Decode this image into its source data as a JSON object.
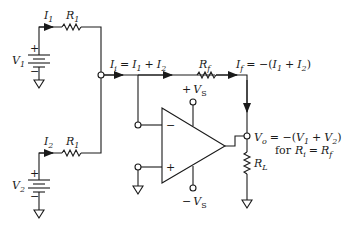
{
  "colors": {
    "ink": "#1a1a1a",
    "background": "#ffffff"
  },
  "sources": [
    {
      "name": "V",
      "sub": "1",
      "polarity_plus": "+",
      "polarity_minus": "−"
    },
    {
      "name": "V",
      "sub": "2",
      "polarity_plus": "+",
      "polarity_minus": "−"
    }
  ],
  "branches": [
    {
      "current": "I",
      "current_sub": "1",
      "resistor": "R",
      "resistor_sub": "1"
    },
    {
      "current": "I",
      "current_sub": "2",
      "resistor": "R",
      "resistor_sub": "1"
    }
  ],
  "node_current": {
    "lhs": "I",
    "lhs_sub": "i",
    "eq": "=",
    "t1": "I",
    "t1_sub": "1",
    "plus": "+",
    "t2": "I",
    "t2_sub": "2"
  },
  "feedback": {
    "resistor": "R",
    "resistor_sub": "f",
    "current": "I",
    "current_sub": "f",
    "eq": "= −(",
    "t1": "I",
    "t1_sub": "1",
    "plus": "+",
    "t2": "I",
    "t2_sub": "2",
    "close": ")"
  },
  "opamp": {
    "inverting": "−",
    "noninverting": "+",
    "supply_pos": {
      "sign": "+",
      "name": "V",
      "sub": "S"
    },
    "supply_neg": {
      "sign": "−",
      "name": "V",
      "sub": "S"
    }
  },
  "output": {
    "name": "V",
    "sub": "o",
    "eq": "= −(",
    "t1": "V",
    "t1_sub": "1",
    "plus": "+",
    "t2": "V",
    "t2_sub": "2",
    "close": ")",
    "condition_prefix": "for",
    "c1": "R",
    "c1_sub": "i",
    "c_eq": "=",
    "c2": "R",
    "c2_sub": "f"
  },
  "load": {
    "resistor": "R",
    "resistor_sub": "L"
  }
}
